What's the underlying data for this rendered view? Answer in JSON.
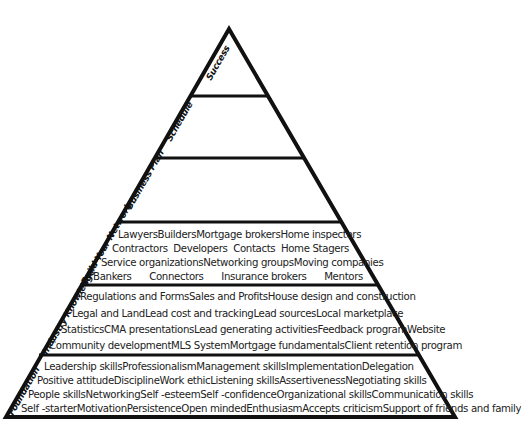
{
  "diagram": {
    "type": "pyramid",
    "stroke_color": "#111111",
    "levels": [
      {
        "label": "Success",
        "rows": []
      },
      {
        "label": "Schedule",
        "rows": []
      },
      {
        "label": "Business Plan",
        "rows": []
      },
      {
        "label": "Build Your Network",
        "rows": [
          [
            "Lawyers",
            "Builders",
            "Mortgage brokers",
            "Home inspectors"
          ],
          [
            "Contractors",
            "Developers",
            "Contacts",
            "Home Stagers"
          ],
          [
            "Service organizations",
            "Networking groups",
            "Moving companies"
          ],
          [
            "Bankers",
            "Connectors",
            "Insurance brokers",
            "Mentors"
          ]
        ]
      },
      {
        "label": "Industry Knowledge",
        "rows": [
          [
            "Regulations and Forms",
            "Sales and Profits",
            "House design and construction"
          ],
          [
            "Legal and Land",
            "Lead cost and tracking",
            "Lead sources",
            "Local marketplace"
          ],
          [
            "Statistics",
            "CMA presentations",
            "Lead generating activities",
            "Feedback program",
            "Website"
          ],
          [
            "Community development",
            "MLS System",
            "Mortgage fundamentals",
            "Client retention program"
          ]
        ]
      },
      {
        "label": "Foundation",
        "rows": [
          [
            "Leadership skills",
            "Professionalism",
            "Management skills",
            "Implementation",
            "Delegation"
          ],
          [
            "Positive attitude",
            "Discipline",
            "Work ethic",
            "Listening skills",
            "Assertiveness",
            "Negotiating skills"
          ],
          [
            "People skills",
            "Networking",
            "Self -esteem",
            "Self -confidence",
            "Organizational skills",
            "Communication skills"
          ],
          [
            "Self -starter",
            "Motivation",
            "Persistence",
            "Open minded",
            "Enthusiasm",
            "Accepts criticism",
            "Support of friends and family"
          ]
        ]
      }
    ]
  }
}
